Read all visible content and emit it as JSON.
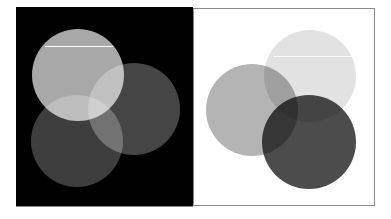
{
  "diagram": {
    "type": "venn-color-mixing",
    "panels": [
      {
        "id": "additive",
        "background": "#000000",
        "blend": "screen",
        "circles": [
          {
            "name": "top",
            "cx": 62,
            "cy": 68,
            "r": 46,
            "color": "#a8a8a8"
          },
          {
            "name": "right",
            "cx": 118,
            "cy": 102,
            "r": 46,
            "color": "#454545"
          },
          {
            "name": "bottom",
            "cx": 61,
            "cy": 134,
            "r": 46,
            "color": "#3e3e3e"
          }
        ],
        "highlight_line": {
          "x1": 29,
          "x2": 97,
          "y": 39,
          "color": "#ffffff"
        }
      },
      {
        "id": "subtractive",
        "background": "#ffffff",
        "blend": "multiply",
        "circles": [
          {
            "name": "top",
            "cx": 116,
            "cy": 67,
            "r": 46,
            "color": "#e2e2e2"
          },
          {
            "name": "left",
            "cx": 58,
            "cy": 101,
            "r": 46,
            "color": "#b4b4b4"
          },
          {
            "name": "bottom",
            "cx": 115,
            "cy": 133,
            "r": 47,
            "color": "#4c4c4c"
          }
        ],
        "highlight_line": {
          "x1": 79,
          "x2": 159,
          "y": 47,
          "color": "#ffffff"
        }
      }
    ]
  }
}
